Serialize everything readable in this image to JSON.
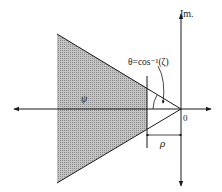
{
  "diagram": {
    "type": "s-plane region diagram",
    "axes": {
      "imaginary_label": "Im.",
      "origin_label": "0"
    },
    "labels": {
      "angle": "θ=cos⁻¹(ζ)",
      "region": "ψ",
      "distance": "ρ"
    },
    "colors": {
      "line": "#1a1a1a",
      "shade": "#a8a8a8",
      "background": "#ffffff"
    }
  }
}
